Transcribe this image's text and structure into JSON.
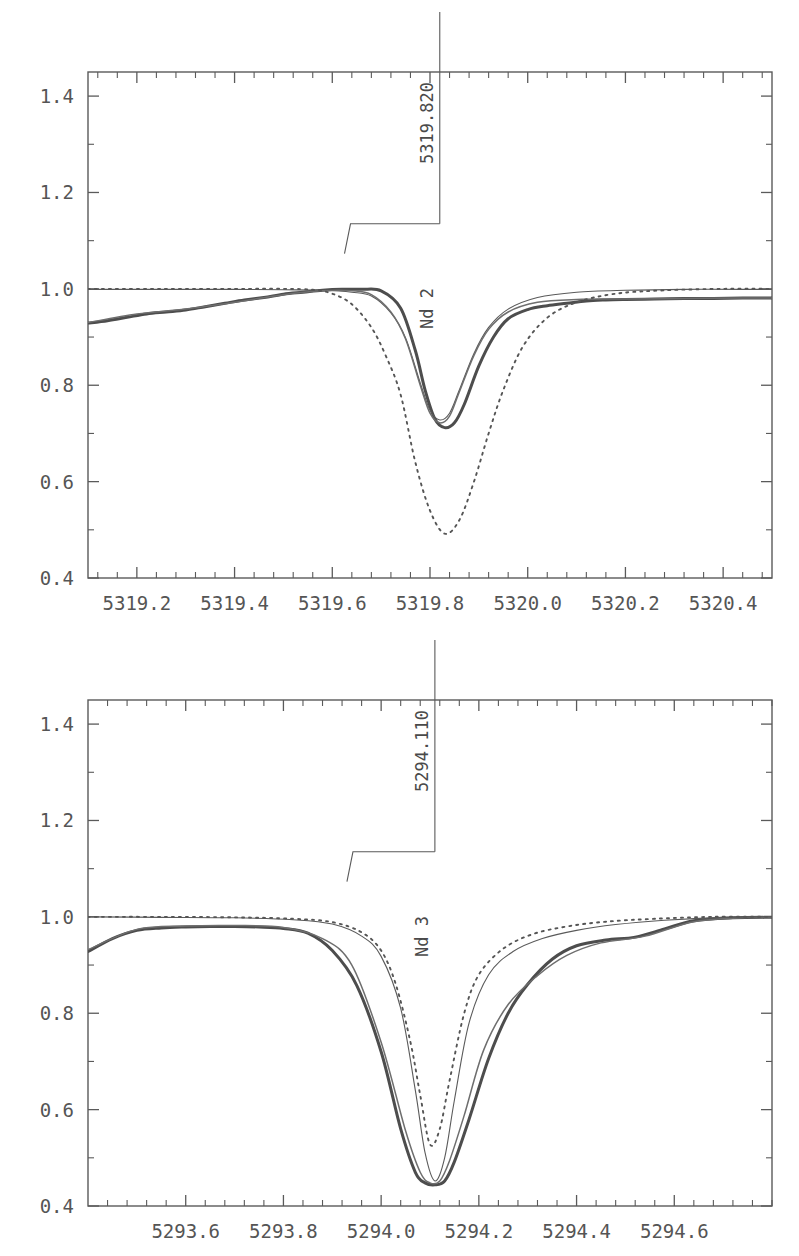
{
  "figure": {
    "title": "",
    "background": "#ffffff",
    "panel_count": 2
  },
  "chart_data": [
    {
      "type": "line",
      "panel": "top",
      "title": "",
      "xlabel": "",
      "ylabel": "",
      "xlim": [
        5319.1,
        5320.5
      ],
      "ylim": [
        0.4,
        1.45
      ],
      "xticks": [
        5319.2,
        5319.4,
        5319.6,
        5319.8,
        5320.0,
        5320.2,
        5320.4
      ],
      "xtick_labels": [
        "5319.2",
        "5319.4",
        "5319.6",
        "5319.8",
        "5320.0",
        "5320.2",
        "5320.4"
      ],
      "yticks": [
        0.4,
        0.6,
        0.8,
        1.0,
        1.2,
        1.4
      ],
      "ytick_labels": [
        "0.4",
        "0.6",
        "0.8",
        "1.0",
        "1.2",
        "1.4"
      ],
      "minor_tick_count": 4,
      "grid": false,
      "legend": "none",
      "annotation": {
        "element": "Nd 2",
        "wavelength": "5319.820",
        "x": 5319.82,
        "leader_kink_x": 5319.625,
        "leader_kink_y": 1.073,
        "leader_corner_y": 1.135
      },
      "series": [
        {
          "name": "observed",
          "style": "solid-thick",
          "color": "#4d4d4d",
          "x": [
            5319.1,
            5319.14,
            5319.18,
            5319.22,
            5319.26,
            5319.3,
            5319.34,
            5319.38,
            5319.42,
            5319.46,
            5319.5,
            5319.54,
            5319.58,
            5319.62,
            5319.66,
            5319.7,
            5319.74,
            5319.77,
            5319.79,
            5319.81,
            5319.83,
            5319.85,
            5319.87,
            5319.9,
            5319.93,
            5319.96,
            5320.0,
            5320.04,
            5320.08,
            5320.12,
            5320.16,
            5320.2,
            5320.26,
            5320.32,
            5320.38,
            5320.44,
            5320.5
          ],
          "y": [
            0.929,
            0.934,
            0.941,
            0.948,
            0.952,
            0.956,
            0.963,
            0.97,
            0.977,
            0.982,
            0.989,
            0.993,
            0.997,
            0.999,
            0.999,
            0.996,
            0.96,
            0.872,
            0.79,
            0.73,
            0.712,
            0.722,
            0.76,
            0.84,
            0.9,
            0.938,
            0.957,
            0.965,
            0.97,
            0.975,
            0.977,
            0.978,
            0.979,
            0.98,
            0.98,
            0.981,
            0.981
          ]
        },
        {
          "name": "synthetic-fit-a",
          "style": "solid-thin",
          "color": "#5a5a5a",
          "x": [
            5319.1,
            5319.2,
            5319.3,
            5319.4,
            5319.5,
            5319.58,
            5319.64,
            5319.68,
            5319.72,
            5319.75,
            5319.78,
            5319.8,
            5319.82,
            5319.84,
            5319.86,
            5319.89,
            5319.92,
            5319.96,
            5320.02,
            5320.1,
            5320.2,
            5320.32,
            5320.44,
            5320.5
          ],
          "y": [
            0.999,
            0.999,
            0.999,
            0.999,
            0.998,
            0.997,
            0.993,
            0.985,
            0.95,
            0.898,
            0.805,
            0.748,
            0.728,
            0.742,
            0.79,
            0.866,
            0.92,
            0.958,
            0.982,
            0.993,
            0.997,
            0.999,
            0.999,
            0.999
          ]
        },
        {
          "name": "synthetic-fit-b",
          "style": "solid-thin",
          "color": "#6e6e6e",
          "x": [
            5319.1,
            5319.2,
            5319.3,
            5319.4,
            5319.5,
            5319.58,
            5319.64,
            5319.68,
            5319.72,
            5319.75,
            5319.78,
            5319.8,
            5319.82,
            5319.84,
            5319.86,
            5319.89,
            5319.92,
            5319.96,
            5320.02,
            5320.1,
            5320.2,
            5320.32,
            5320.44,
            5320.5
          ],
          "y": [
            0.93,
            0.948,
            0.958,
            0.972,
            0.988,
            0.996,
            0.996,
            0.988,
            0.952,
            0.896,
            0.8,
            0.742,
            0.722,
            0.736,
            0.786,
            0.862,
            0.916,
            0.952,
            0.972,
            0.978,
            0.979,
            0.98,
            0.981,
            0.981
          ]
        },
        {
          "name": "synthetic-dotted",
          "style": "dotted",
          "color": "#555555",
          "x": [
            5319.1,
            5319.25,
            5319.4,
            5319.5,
            5319.56,
            5319.6,
            5319.64,
            5319.68,
            5319.71,
            5319.74,
            5319.77,
            5319.8,
            5319.83,
            5319.86,
            5319.89,
            5319.92,
            5319.95,
            5319.99,
            5320.04,
            5320.1,
            5320.18,
            5320.28,
            5320.4,
            5320.5
          ],
          "y": [
            1.0,
            1.0,
            1.0,
            1.0,
            0.998,
            0.99,
            0.968,
            0.92,
            0.86,
            0.78,
            0.64,
            0.54,
            0.492,
            0.52,
            0.6,
            0.7,
            0.79,
            0.88,
            0.94,
            0.972,
            0.99,
            0.997,
            1.0,
            1.0
          ]
        }
      ]
    },
    {
      "type": "line",
      "panel": "bottom",
      "title": "",
      "xlabel": "",
      "ylabel": "",
      "xlim": [
        5293.4,
        5294.8
      ],
      "ylim": [
        0.4,
        1.45
      ],
      "xticks": [
        5293.6,
        5293.8,
        5294.0,
        5294.2,
        5294.4,
        5294.6
      ],
      "xtick_labels": [
        "5293.6",
        "5293.8",
        "5294.0",
        "5294.2",
        "5294.4",
        "5294.6"
      ],
      "yticks": [
        0.4,
        0.6,
        0.8,
        1.0,
        1.2,
        1.4
      ],
      "ytick_labels": [
        "0.4",
        "0.6",
        "0.8",
        "1.0",
        "1.2",
        "1.4"
      ],
      "minor_tick_count": 4,
      "grid": false,
      "legend": "none",
      "annotation": {
        "element": "Nd 3",
        "wavelength": "5294.110",
        "x": 5294.11,
        "leader_kink_x": 5293.93,
        "leader_kink_y": 1.073,
        "leader_corner_y": 1.135
      },
      "series": [
        {
          "name": "observed",
          "style": "solid-thick",
          "color": "#4d4d4d",
          "x": [
            5293.4,
            5293.45,
            5293.5,
            5293.55,
            5293.6,
            5293.65,
            5293.7,
            5293.75,
            5293.8,
            5293.85,
            5293.9,
            5293.95,
            5294.0,
            5294.04,
            5294.07,
            5294.09,
            5294.11,
            5294.13,
            5294.15,
            5294.18,
            5294.22,
            5294.26,
            5294.3,
            5294.35,
            5294.4,
            5294.46,
            5294.52,
            5294.58,
            5294.64,
            5294.72,
            5294.8
          ],
          "y": [
            0.928,
            0.955,
            0.972,
            0.977,
            0.979,
            0.98,
            0.98,
            0.979,
            0.976,
            0.966,
            0.93,
            0.858,
            0.72,
            0.56,
            0.47,
            0.448,
            0.444,
            0.452,
            0.492,
            0.58,
            0.706,
            0.8,
            0.86,
            0.912,
            0.94,
            0.952,
            0.958,
            0.975,
            0.992,
            0.998,
            0.999
          ]
        },
        {
          "name": "observed-trace-2",
          "style": "solid-thin",
          "color": "#6e6e6e",
          "x": [
            5293.4,
            5293.5,
            5293.6,
            5293.7,
            5293.8,
            5293.88,
            5293.94,
            5294.0,
            5294.05,
            5294.08,
            5294.1,
            5294.12,
            5294.14,
            5294.17,
            5294.21,
            5294.26,
            5294.32,
            5294.38,
            5294.45,
            5294.54,
            5294.64,
            5294.74,
            5294.8
          ],
          "y": [
            0.932,
            0.974,
            0.981,
            0.982,
            0.978,
            0.955,
            0.9,
            0.74,
            0.556,
            0.47,
            0.448,
            0.452,
            0.494,
            0.588,
            0.724,
            0.818,
            0.878,
            0.92,
            0.946,
            0.96,
            0.99,
            0.998,
            0.999
          ]
        },
        {
          "name": "synthetic-fit",
          "style": "solid-thin",
          "color": "#5a5a5a",
          "x": [
            5293.4,
            5293.55,
            5293.7,
            5293.82,
            5293.9,
            5293.96,
            5294.0,
            5294.04,
            5294.07,
            5294.09,
            5294.11,
            5294.13,
            5294.15,
            5294.18,
            5294.22,
            5294.27,
            5294.33,
            5294.4,
            5294.48,
            5294.58,
            5294.7,
            5294.8
          ],
          "y": [
            1.0,
            0.999,
            0.998,
            0.994,
            0.985,
            0.96,
            0.918,
            0.81,
            0.64,
            0.51,
            0.452,
            0.5,
            0.62,
            0.78,
            0.88,
            0.928,
            0.955,
            0.972,
            0.984,
            0.993,
            0.999,
            1.0
          ]
        },
        {
          "name": "synthetic-dotted",
          "style": "dotted",
          "color": "#555555",
          "x": [
            5293.4,
            5293.55,
            5293.7,
            5293.82,
            5293.9,
            5293.96,
            5294.0,
            5294.03,
            5294.06,
            5294.08,
            5294.1,
            5294.12,
            5294.14,
            5294.17,
            5294.2,
            5294.25,
            5294.31,
            5294.38,
            5294.46,
            5294.56,
            5294.68,
            5294.8
          ],
          "y": [
            1.0,
            1.0,
            0.999,
            0.996,
            0.989,
            0.968,
            0.93,
            0.86,
            0.74,
            0.63,
            0.528,
            0.56,
            0.66,
            0.8,
            0.88,
            0.934,
            0.964,
            0.98,
            0.99,
            0.996,
            1.0,
            1.0
          ]
        }
      ]
    }
  ]
}
